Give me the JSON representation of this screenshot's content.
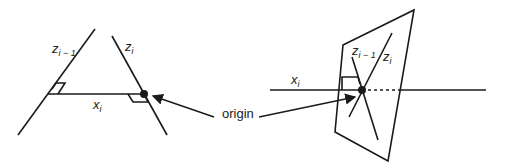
{
  "diagram": {
    "left_panel": {
      "axis_prev": {
        "name": "z",
        "subscript": "i − 1"
      },
      "axis_curr": {
        "name": "z",
        "subscript": "i"
      },
      "common_normal": {
        "name": "x",
        "subscript": "i"
      }
    },
    "right_panel": {
      "axis_prev": {
        "name": "z",
        "subscript": "i − 1"
      },
      "axis_curr": {
        "name": "z",
        "subscript": "i"
      },
      "common_normal": {
        "name": "x",
        "subscript": "i"
      }
    },
    "annotation": {
      "label": "origin"
    },
    "colors": {
      "stroke": "#1a1a1a",
      "background": "#ffffff"
    }
  }
}
